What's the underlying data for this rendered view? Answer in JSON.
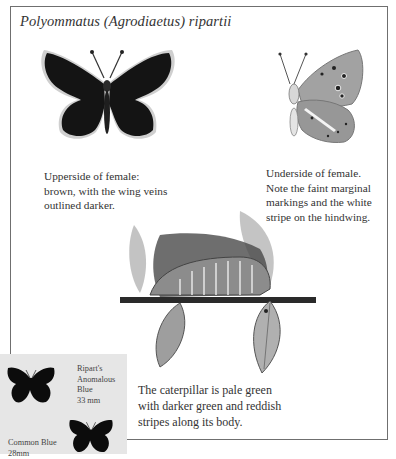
{
  "page": {
    "title": "Polyommatus (Agrodiaetus) ripartii"
  },
  "illustrations": [
    {
      "id": "upperside-female",
      "icon": "butterfly-upperside-illustration",
      "caption_lines": [
        "Upperside of female:",
        "brown, with the wing veins",
        "outlined darker."
      ]
    },
    {
      "id": "underside-female",
      "icon": "butterfly-underside-illustration",
      "caption_lines": [
        "Underside of female.",
        "Note the faint marginal",
        "markings and the white",
        "stripe on the hindwing."
      ]
    },
    {
      "id": "caterpillar",
      "icon": "caterpillar-illustration",
      "caption_lines": [
        "The caterpillar is pale green",
        "with darker green and reddish",
        "stripes along its body."
      ]
    }
  ],
  "size_comparison": {
    "species": [
      {
        "name_lines": [
          "Ripart's",
          "Anomalous",
          "Blue"
        ],
        "size": "33 mm",
        "icon": "butterfly-silhouette"
      },
      {
        "name_lines": [
          "Common Blue"
        ],
        "size": "28mm",
        "icon": "butterfly-silhouette"
      }
    ]
  },
  "colors": {
    "frame_border": "#6f6f6f",
    "inset_bg": "#e6e6e6",
    "wing_dark": "#141414",
    "wing_fringe": "#c8c8c8",
    "underside_wing": "#9a9a9a",
    "leaf": "#a8a8a8"
  }
}
